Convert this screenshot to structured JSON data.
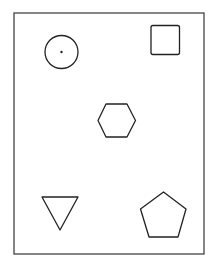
{
  "diagram": {
    "frame": {
      "x": 14,
      "y": 13,
      "w": 190,
      "h": 241
    },
    "stroke_color": "#222222",
    "shapes": [
      {
        "type": "circle",
        "label": "circle-with-dot"
      },
      {
        "type": "square",
        "label": "rounded-square"
      },
      {
        "type": "hexagon",
        "label": "hexagon"
      },
      {
        "type": "triangle",
        "label": "downward-triangle"
      },
      {
        "type": "pentagon",
        "label": "pentagon"
      }
    ]
  }
}
